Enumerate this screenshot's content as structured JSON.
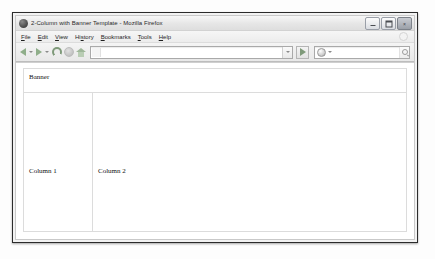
{
  "window": {
    "title": "2-Column with Banner Template - Mozilla Firefox",
    "app_icon": "firefox-globe-icon",
    "controls": {
      "minimize_label": "",
      "maximize_label": "",
      "close_label": "×"
    }
  },
  "menubar": {
    "items": [
      {
        "label": "File",
        "accel": "F"
      },
      {
        "label": "Edit",
        "accel": "E"
      },
      {
        "label": "View",
        "accel": "V"
      },
      {
        "label": "History",
        "accel": "s"
      },
      {
        "label": "Bookmarks",
        "accel": "B"
      },
      {
        "label": "Tools",
        "accel": "T"
      },
      {
        "label": "Help",
        "accel": "H"
      }
    ]
  },
  "toolbar": {
    "back_icon": "back-arrow-icon",
    "forward_icon": "forward-arrow-icon",
    "reload_icon": "reload-icon",
    "stop_icon": "stop-icon",
    "home_icon": "home-icon",
    "address": {
      "value": "",
      "placeholder": ""
    },
    "go_icon": "go-arrow-icon",
    "search": {
      "value": "",
      "placeholder": "",
      "engine_icon": "search-engine-icon",
      "magnifier_icon": "magnifier-icon"
    }
  },
  "page": {
    "banner": {
      "label": "Banner"
    },
    "columns": [
      {
        "label": "Column 1"
      },
      {
        "label": "Column 2"
      }
    ]
  },
  "colors": {
    "window_frame": "#2b2b2b",
    "titlebar_bg": "#e6e6e6",
    "toolbar_bg": "#ececec",
    "page_bg": "#ffffff",
    "page_border": "#dcdcdc",
    "accent_green": "#8fae8a",
    "text": "#111111"
  }
}
